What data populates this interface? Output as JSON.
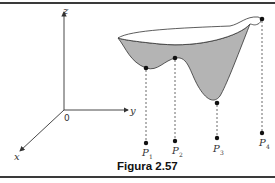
{
  "figure": {
    "caption": "Figura 2.57",
    "axes": {
      "z_label": "z",
      "y_label": "y",
      "x_label": "x",
      "origin_label": "0"
    },
    "points": [
      {
        "name": "P",
        "sub": "1"
      },
      {
        "name": "P",
        "sub": "2"
      },
      {
        "name": "P",
        "sub": "3"
      },
      {
        "name": "P",
        "sub": "4"
      }
    ],
    "colors": {
      "surface_fill": "#b4b4b4",
      "line": "#333333"
    }
  }
}
